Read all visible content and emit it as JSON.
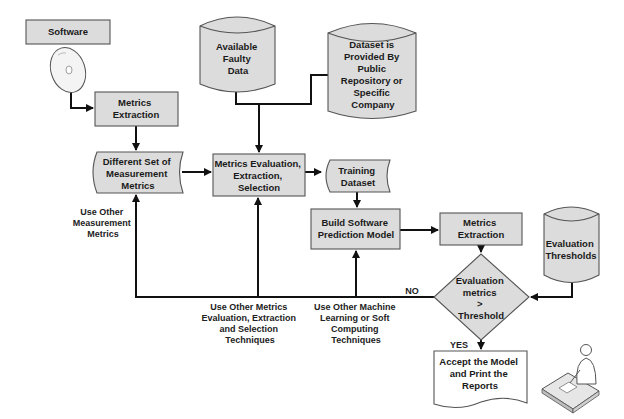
{
  "diagram": {
    "nodes": {
      "software": {
        "label": "Software",
        "shape": "rectangle"
      },
      "cd_disc": {
        "label": "",
        "icon": "cd-disc-icon"
      },
      "metrics_extraction_left": {
        "lines": [
          "Metrics",
          "Extraction"
        ],
        "shape": "rectangle"
      },
      "measurement_metrics": {
        "lines": [
          "Different Set of",
          "Measurement",
          "Metrics"
        ],
        "shape": "stored-data"
      },
      "available_faulty_data": {
        "lines": [
          "Available",
          "Faulty",
          "Data"
        ],
        "shape": "cylinder"
      },
      "public_dataset": {
        "lines": [
          "Dataset is",
          "Provided By",
          "Public",
          "Repository or",
          "Specific",
          "Company"
        ],
        "shape": "cylinder"
      },
      "metrics_evaluation": {
        "lines": [
          "Metrics Evaluation,",
          "Extraction,",
          "Selection"
        ],
        "shape": "rectangle"
      },
      "training_dataset": {
        "lines": [
          "Training",
          "Dataset"
        ],
        "shape": "stored-data"
      },
      "build_model": {
        "lines": [
          "Build Software",
          "Prediction Model"
        ],
        "shape": "rectangle"
      },
      "metrics_extraction_right": {
        "lines": [
          "Metrics",
          "Extraction"
        ],
        "shape": "rectangle"
      },
      "evaluation_thresholds": {
        "lines": [
          "Evaluation",
          "Thresholds"
        ],
        "shape": "cylinder"
      },
      "decision": {
        "lines": [
          "Evaluation",
          "metrics",
          ">",
          "Threshold"
        ],
        "shape": "diamond"
      },
      "accept_model": {
        "lines": [
          "Accept the Model",
          "and Print the",
          "Reports"
        ],
        "shape": "document"
      },
      "user_at_desk": {
        "label": "",
        "icon": "person-at-desk-icon"
      }
    },
    "edge_labels": {
      "no": "NO",
      "yes": "YES",
      "use_other_measurement": [
        "Use Other",
        "Measurement",
        "Metrics"
      ],
      "use_other_evaluation": [
        "Use Other Metrics",
        "Evaluation, Extraction",
        "and Selection",
        "Techniques"
      ],
      "use_other_ml": [
        "Use Other Machine",
        "Learning or Soft",
        "Computing",
        "Techniques"
      ]
    },
    "colors": {
      "shape_fill": "#dcdcdc",
      "shape_stroke": "#555555",
      "line": "#111111",
      "text": "#1a1a1a",
      "background": "#ffffff"
    }
  }
}
